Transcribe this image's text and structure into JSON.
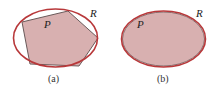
{
  "colors": {
    "region_stroke": "#b8383a",
    "fill": "#d8b0b0",
    "polygon_stroke": "#6a5a5a",
    "background": "#ffffff"
  },
  "panels": [
    {
      "caption": "(a)",
      "region_label": "R",
      "polygon_label": "P",
      "ellipse": {
        "cx": 55.5,
        "cy": 38,
        "rx": 42,
        "ry": 29
      },
      "polygon_points": "22,22 68,11 98,38 79,66 30,64"
    },
    {
      "caption": "(b)",
      "region_label": "R",
      "polygon_label": "P",
      "ellipse": {
        "cx": 163.5,
        "cy": 39,
        "rx": 42,
        "ry": 28
      }
    }
  ]
}
